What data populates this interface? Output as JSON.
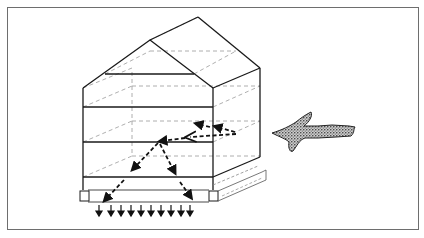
{
  "figure": {
    "colors": {
      "line": "#1a1a1a",
      "dashed": "#9a9a9a",
      "frame": "#6e6e6e",
      "background": "#ffffff"
    },
    "elements": {
      "structure": "gabled box with three shelves",
      "flow_arrows": "dashed black arrows entering from right, splitting downward",
      "drip_arrows_count": 10,
      "incoming_arrow": "stippled branch-shaped arrow pointing left"
    }
  }
}
